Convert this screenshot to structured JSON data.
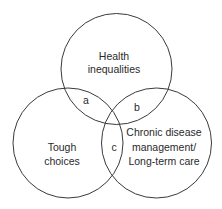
{
  "diagram": {
    "type": "venn",
    "circles": [
      {
        "id": "top",
        "label_lines": [
          "Health",
          "inequalities"
        ]
      },
      {
        "id": "left",
        "label_lines": [
          "Tough",
          "choices"
        ]
      },
      {
        "id": "right",
        "label_lines": [
          "Chronic disease",
          "management/",
          "Long-term care"
        ]
      }
    ],
    "intersections": {
      "a": "a",
      "b": "b",
      "c": "c"
    },
    "colors": {
      "stroke": "#3a3a3a",
      "text": "#2a2a2a",
      "background": "#ffffff"
    }
  }
}
